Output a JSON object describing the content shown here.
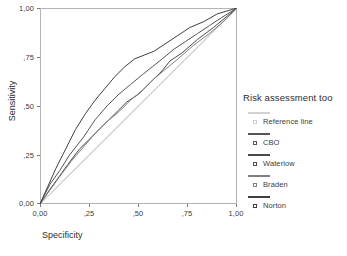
{
  "chart_data": {
    "type": "line",
    "title": "",
    "xlabel": "Specificity",
    "ylabel": "Sensitivity",
    "xlim": [
      0,
      1
    ],
    "ylim": [
      0,
      1
    ],
    "grid": false,
    "legend_position": "right",
    "legend_title": "Risk assessment too",
    "x_ticks": [
      "0,00",
      ",25",
      ",50",
      ",75",
      "1,00"
    ],
    "x_tick_values": [
      0,
      0.25,
      0.5,
      0.75,
      1.0
    ],
    "y_ticks": [
      "0,00",
      ",25",
      ",50",
      ",75",
      "1,00"
    ],
    "y_tick_values": [
      0,
      0.25,
      0.5,
      0.75,
      1.0
    ],
    "series": [
      {
        "name": "Reference line",
        "color": "#d2d2d2",
        "x": [
          0,
          1
        ],
        "y": [
          0,
          1
        ]
      },
      {
        "name": "CBO",
        "color": "#555555",
        "x": [
          0,
          0.05,
          0.1,
          0.15,
          0.22,
          0.28,
          0.34,
          0.4,
          0.46,
          0.52,
          0.57,
          0.62,
          0.68,
          0.74,
          0.8,
          0.86,
          0.92,
          1.0
        ],
        "y": [
          0,
          0.1,
          0.17,
          0.25,
          0.34,
          0.43,
          0.5,
          0.56,
          0.61,
          0.66,
          0.7,
          0.74,
          0.79,
          0.83,
          0.87,
          0.91,
          0.95,
          1.0
        ]
      },
      {
        "name": "Waterlow",
        "color": "#4a4a4a",
        "x": [
          0,
          0.04,
          0.09,
          0.14,
          0.2,
          0.26,
          0.32,
          0.38,
          0.44,
          0.5,
          0.56,
          0.62,
          0.66,
          0.72,
          0.8,
          0.88,
          1.0
        ],
        "y": [
          0,
          0.06,
          0.13,
          0.2,
          0.28,
          0.34,
          0.4,
          0.46,
          0.52,
          0.56,
          0.62,
          0.68,
          0.73,
          0.77,
          0.84,
          0.9,
          1.0
        ]
      },
      {
        "name": "Braden",
        "color": "#808080",
        "x": [
          0,
          0.05,
          0.1,
          0.16,
          0.22,
          0.28,
          0.34,
          0.4,
          0.46,
          0.52,
          0.58,
          0.64,
          0.7,
          0.78,
          0.86,
          0.93,
          1.0
        ],
        "y": [
          0,
          0.07,
          0.14,
          0.22,
          0.29,
          0.36,
          0.42,
          0.47,
          0.53,
          0.58,
          0.64,
          0.69,
          0.74,
          0.81,
          0.87,
          0.93,
          1.0
        ]
      },
      {
        "name": "Norton",
        "color": "#3f3f3f",
        "x": [
          0,
          0.04,
          0.08,
          0.13,
          0.18,
          0.23,
          0.28,
          0.33,
          0.38,
          0.43,
          0.48,
          0.53,
          0.58,
          0.64,
          0.7,
          0.76,
          0.83,
          0.9,
          1.0
        ],
        "y": [
          0,
          0.09,
          0.18,
          0.28,
          0.38,
          0.46,
          0.53,
          0.59,
          0.65,
          0.7,
          0.74,
          0.76,
          0.78,
          0.82,
          0.86,
          0.9,
          0.93,
          0.97,
          1.0
        ]
      }
    ]
  },
  "axes": {
    "y_title": "Sensitivity",
    "x_title": "Specificity",
    "y_tick_labels": [
      "1,00",
      ",75",
      ",50",
      ",25",
      "0,00"
    ],
    "x_tick_labels": [
      "0,00",
      ",25",
      ",50",
      ",75",
      "1,00"
    ]
  },
  "legend": {
    "title": "Risk assessment too",
    "items": [
      {
        "label": "Reference line",
        "color": "#d2d2d2"
      },
      {
        "label": "CBO",
        "color": "#555555"
      },
      {
        "label": "Waterlow",
        "color": "#4a4a4a"
      },
      {
        "label": "Braden",
        "color": "#808080"
      },
      {
        "label": "Norton",
        "color": "#3f3f3f"
      }
    ]
  }
}
